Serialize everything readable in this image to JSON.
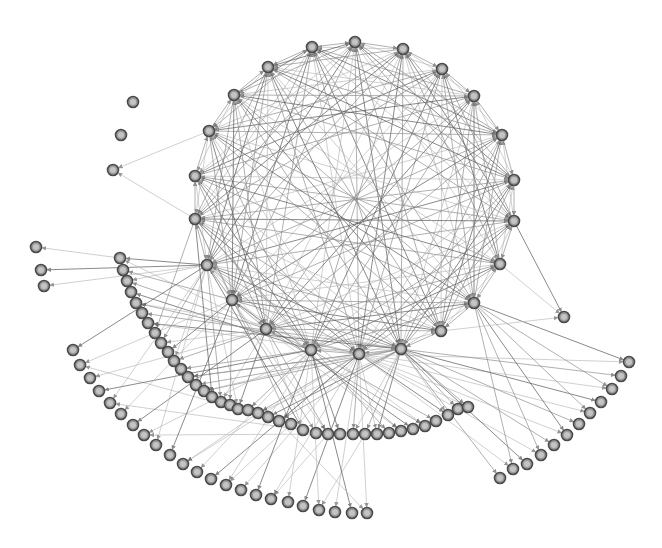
{
  "diagram": {
    "type": "directed-network",
    "background": "#ffffff",
    "node_style": {
      "radius": 5.5,
      "fill": "#9a9a9a",
      "stroke": "#4a4a4a",
      "inner": "#c4c4c4"
    },
    "edge_style": {
      "color": "#8a8a8a",
      "arrowheads": true
    },
    "ring_nodes": [
      [
        312,
        47
      ],
      [
        355,
        42
      ],
      [
        403,
        49
      ],
      [
        442,
        69
      ],
      [
        474,
        96
      ],
      [
        502,
        135
      ],
      [
        514,
        180
      ],
      [
        514,
        221
      ],
      [
        500,
        264
      ],
      [
        474,
        303
      ],
      [
        441,
        331
      ],
      [
        401,
        349
      ],
      [
        359,
        354
      ],
      [
        311,
        350
      ],
      [
        266,
        329
      ],
      [
        232,
        300
      ],
      [
        207,
        265
      ],
      [
        195,
        219
      ],
      [
        195,
        176
      ],
      [
        209,
        131
      ],
      [
        234,
        95
      ],
      [
        268,
        67
      ]
    ],
    "isolated_nodes": [
      [
        133,
        102
      ],
      [
        121,
        135
      ],
      [
        113,
        170
      ]
    ],
    "left_leaves": [
      [
        36,
        247
      ],
      [
        41,
        270
      ],
      [
        44,
        286
      ]
    ],
    "left_arc": [
      [
        120,
        258
      ],
      [
        123,
        270
      ],
      [
        127,
        281
      ],
      [
        131,
        292
      ],
      [
        136,
        303
      ],
      [
        142,
        313
      ],
      [
        148,
        323
      ],
      [
        155,
        333
      ],
      [
        161,
        343
      ],
      [
        168,
        352
      ],
      [
        174,
        361
      ],
      [
        181,
        369
      ],
      [
        188,
        377
      ],
      [
        196,
        385
      ],
      [
        204,
        391
      ],
      [
        212,
        397
      ],
      [
        221,
        402
      ],
      [
        230,
        405
      ],
      [
        238,
        409
      ],
      [
        248,
        410
      ],
      [
        258,
        413
      ],
      [
        268,
        417
      ],
      [
        279,
        421
      ],
      [
        291,
        424
      ],
      [
        303,
        430
      ],
      [
        316,
        433
      ],
      [
        328,
        434
      ],
      [
        340,
        434
      ],
      [
        353,
        434
      ],
      [
        365,
        434
      ],
      [
        377,
        434
      ],
      [
        389,
        433
      ],
      [
        401,
        431
      ],
      [
        413,
        429
      ],
      [
        425,
        426
      ],
      [
        436,
        421
      ],
      [
        448,
        415
      ],
      [
        458,
        409
      ],
      [
        468,
        407
      ]
    ],
    "outer_left_arc": [
      [
        73,
        350
      ],
      [
        80,
        365
      ],
      [
        90,
        378
      ],
      [
        99,
        391
      ],
      [
        110,
        403
      ],
      [
        121,
        414
      ],
      [
        133,
        425
      ],
      [
        144,
        435
      ],
      [
        156,
        445
      ],
      [
        170,
        455
      ],
      [
        183,
        464
      ],
      [
        197,
        472
      ],
      [
        211,
        479
      ],
      [
        226,
        485
      ],
      [
        241,
        490
      ],
      [
        256,
        495
      ],
      [
        271,
        499
      ],
      [
        288,
        502
      ],
      [
        303,
        506
      ],
      [
        319,
        510
      ],
      [
        335,
        512
      ],
      [
        352,
        513
      ],
      [
        367,
        513
      ]
    ],
    "outer_right_arc": [
      [
        629,
        362
      ],
      [
        621,
        376
      ],
      [
        612,
        389
      ],
      [
        601,
        402
      ],
      [
        590,
        413
      ],
      [
        579,
        424
      ],
      [
        567,
        435
      ],
      [
        554,
        445
      ],
      [
        541,
        455
      ],
      [
        527,
        464
      ],
      [
        513,
        469
      ],
      [
        500,
        478
      ]
    ],
    "right_leaf": [
      [
        564,
        317
      ]
    ],
    "hubs": {
      "ring_left_bottom": 16,
      "ring_bottom": 13,
      "ring_bottom_right": 11
    }
  }
}
